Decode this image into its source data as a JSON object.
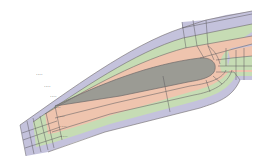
{
  "diagram": {
    "title": "",
    "colors": {
      "background": "#ffffff",
      "airfoil": "#9b9b94",
      "inner_band": "#efc4ae",
      "middle_band": "#c6dcb4",
      "outer_band": "#c4c2dc",
      "edge_line": "#6e6a6a",
      "grid_line": "#5c5a5e",
      "marker": "#333333"
    },
    "layers": [
      {
        "name": "airfoil",
        "label": ""
      },
      {
        "name": "inner-band",
        "label": ""
      },
      {
        "name": "middle-band",
        "label": ""
      },
      {
        "name": "outer-band",
        "label": ""
      }
    ],
    "markers": [
      {
        "name": "marker-1",
        "text": "····"
      },
      {
        "name": "marker-2",
        "text": "····"
      },
      {
        "name": "marker-3",
        "text": "····"
      },
      {
        "name": "marker-4",
        "text": "····"
      },
      {
        "name": "marker-5",
        "text": "····"
      },
      {
        "name": "marker-6",
        "text": "····"
      },
      {
        "name": "marker-7",
        "text": "····"
      }
    ]
  }
}
